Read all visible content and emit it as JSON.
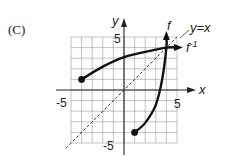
{
  "panel": {
    "label": "(C)"
  },
  "chart_data": {
    "type": "line",
    "title": "",
    "xlabel": "x",
    "ylabel": "y",
    "xlim": [
      -5,
      5
    ],
    "ylim": [
      -5,
      5
    ],
    "grid": true,
    "tick_labels": {
      "x_neg": "-5",
      "x_pos": "5",
      "y_pos": "5",
      "y_neg": "-5"
    },
    "series": [
      {
        "name": "f^-1",
        "label": "f",
        "sup": "-1",
        "style": "solid-thick",
        "start_point": [
          -4,
          1
        ],
        "points": [
          [
            -4,
            1
          ],
          [
            -2,
            2.2
          ],
          [
            0,
            3.1
          ],
          [
            2,
            3.6
          ],
          [
            4,
            4
          ],
          [
            5,
            4
          ]
        ],
        "end": "arrow"
      },
      {
        "name": "f",
        "label": "f",
        "style": "solid-thick",
        "start_point": [
          1,
          -4
        ],
        "points": [
          [
            1,
            -4
          ],
          [
            2,
            -3.1
          ],
          [
            3,
            -1.4
          ],
          [
            3.6,
            1
          ],
          [
            4,
            4
          ],
          [
            4,
            5
          ]
        ],
        "end": "arrow"
      },
      {
        "name": "y=x",
        "label": "y=x",
        "style": "dashed",
        "points": [
          [
            -5.5,
            -5.5
          ],
          [
            5,
            5
          ]
        ]
      }
    ],
    "annotations": [
      "y=x",
      "f",
      "f^-1"
    ]
  }
}
